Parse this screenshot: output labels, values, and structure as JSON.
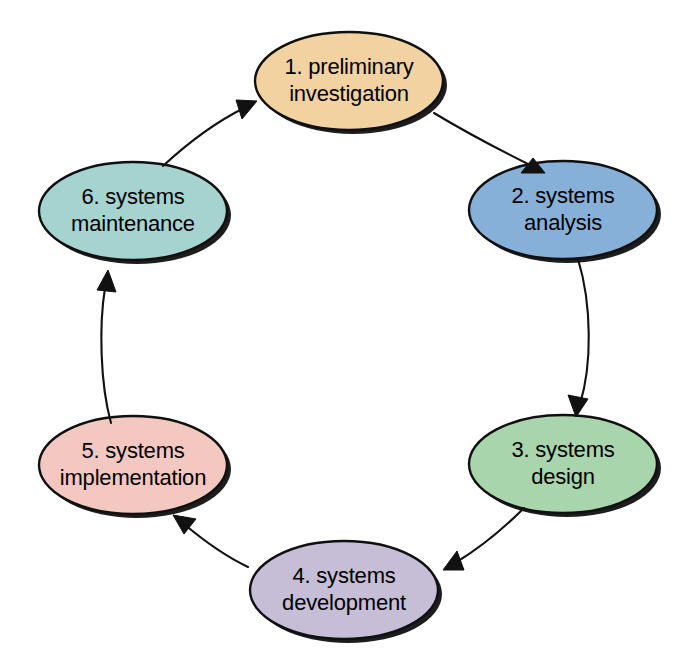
{
  "diagram": {
    "type": "cyclical-flow",
    "background_color": "#ffffff",
    "outline_color": "#101010",
    "arrow_color": "#111111",
    "text_color": "#000000",
    "nodes": [
      {
        "id": "node-1",
        "number": "1.",
        "label": "1.  preliminary\ninvestigation",
        "line1": "1.  preliminary",
        "line2": "investigation",
        "fill_color": "#f2d2a0",
        "cx": 349,
        "cy": 81,
        "rx": 94,
        "ry": 49
      },
      {
        "id": "node-2",
        "number": "2.",
        "label": "2.  systems\nanalysis",
        "line1": "2.  systems",
        "line2": "analysis",
        "fill_color": "#86b0d8",
        "cx": 563,
        "cy": 210,
        "rx": 94,
        "ry": 49
      },
      {
        "id": "node-3",
        "number": "3.",
        "label": "3.  systems\ndesign",
        "line1": "3.  systems",
        "line2": "design",
        "fill_color": "#a8d5ab",
        "cx": 563,
        "cy": 464,
        "rx": 94,
        "ry": 49
      },
      {
        "id": "node-4",
        "number": "4.",
        "label": "4.  systems\ndevelopment",
        "line1": "4.  systems",
        "line2": "development",
        "fill_color": "#c5bed6",
        "cx": 344,
        "cy": 590,
        "rx": 94,
        "ry": 49
      },
      {
        "id": "node-5",
        "number": "5.",
        "label": "5.  systems\nimplementation",
        "line1": "5.  systems",
        "line2": "implementation",
        "fill_color": "#f3c8c0",
        "cx": 133,
        "cy": 465,
        "rx": 94,
        "ry": 49
      },
      {
        "id": "node-6",
        "number": "6.",
        "label": "6.  systems\nmaintenance",
        "line1": "6.  systems",
        "line2": "maintenance",
        "fill_color": "#a5d3d0",
        "cx": 133,
        "cy": 211,
        "rx": 94,
        "ry": 49
      }
    ],
    "arrows": [
      {
        "id": "arrow-1-to-2",
        "from": "node-1",
        "to": "node-2"
      },
      {
        "id": "arrow-2-to-3",
        "from": "node-2",
        "to": "node-3"
      },
      {
        "id": "arrow-3-to-4",
        "from": "node-3",
        "to": "node-4"
      },
      {
        "id": "arrow-4-to-5",
        "from": "node-4",
        "to": "node-5"
      },
      {
        "id": "arrow-5-to-6",
        "from": "node-5",
        "to": "node-6"
      },
      {
        "id": "arrow-6-to-1",
        "from": "node-6",
        "to": "node-1"
      }
    ]
  }
}
